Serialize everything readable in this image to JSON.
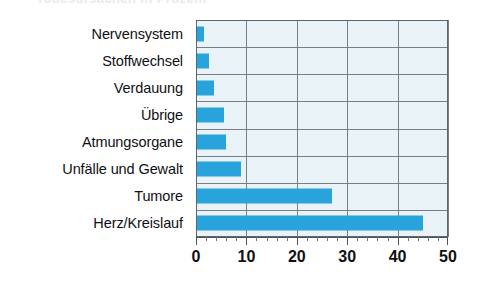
{
  "title_strip": {
    "text": "Todesursachen in Prozent"
  },
  "chart_data": {
    "type": "bar",
    "orientation": "horizontal",
    "title": "",
    "subtitle": "",
    "xlabel": "",
    "ylabel": "",
    "categories": [
      "Nervensystem",
      "Stoffwechsel",
      "Verdauung",
      "Übrige",
      "Atmungsorgane",
      "Unfälle und Gewalt",
      "Tumore",
      "Herz/Kreislauf"
    ],
    "values": [
      1.5,
      2.5,
      3.5,
      5.5,
      6,
      9,
      27,
      45
    ],
    "xlim": [
      0,
      50
    ],
    "xticks": [
      0,
      10,
      20,
      30,
      40,
      50
    ],
    "xticklabels": [
      "0",
      "10",
      "20",
      "30",
      "40",
      "50"
    ],
    "minor_tick_step": 2,
    "grid": "both",
    "legend": "none",
    "series": [
      {
        "name": "Anteil",
        "color": "#29a3dc",
        "values": [
          1.5,
          2.5,
          3.5,
          5.5,
          6,
          9,
          27,
          45
        ]
      }
    ]
  },
  "colors": {
    "bar": "#29a3dc",
    "plot_background": "#e9f2f7",
    "gridline": "#767e86",
    "axis_line": "#4c545c",
    "text": "#101014",
    "page_background": "#ffffff"
  }
}
